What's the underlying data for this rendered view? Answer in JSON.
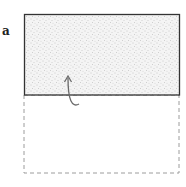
{
  "figure": {
    "panel_label": "a",
    "solid_rect": {
      "x": 24,
      "y": 14,
      "width": 155,
      "height": 81,
      "fill": "stippled",
      "stroke": "#333333"
    },
    "dashed_rect": {
      "x": 24,
      "y": 95,
      "width": 155,
      "height": 78,
      "stroke": "#999999"
    },
    "arrow": {
      "direction": "up",
      "color": "#666666"
    }
  }
}
